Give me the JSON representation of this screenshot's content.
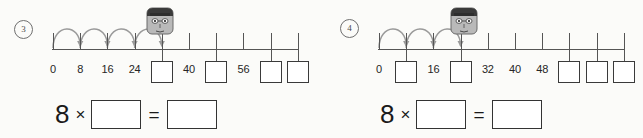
{
  "worksheet": {
    "background_color": "#fbfbf9",
    "ink_color": "#333333",
    "arc_color": "#9a9a9a",
    "panels": [
      {
        "id": "problem-3",
        "number_label": "3",
        "marker_icon": "student-head-icon",
        "marker_tick_index": 4,
        "jump_count": 4,
        "axis": {
          "tick_count": 10,
          "step": 8,
          "start": 0,
          "end": 72
        },
        "ticks": [
          {
            "index": 0,
            "type": "label",
            "text": "0"
          },
          {
            "index": 1,
            "type": "label",
            "text": "8"
          },
          {
            "index": 2,
            "type": "label",
            "text": "16"
          },
          {
            "index": 3,
            "type": "label",
            "text": "24"
          },
          {
            "index": 4,
            "type": "box",
            "text": ""
          },
          {
            "index": 5,
            "type": "label",
            "text": "40"
          },
          {
            "index": 6,
            "type": "box",
            "text": ""
          },
          {
            "index": 7,
            "type": "label",
            "text": "56"
          },
          {
            "index": 8,
            "type": "box",
            "text": ""
          },
          {
            "index": 9,
            "type": "box",
            "text": ""
          }
        ],
        "equation": {
          "factor": "8",
          "operator": "×",
          "equals": "=",
          "factor_answer": "",
          "product_answer": ""
        }
      },
      {
        "id": "problem-4",
        "number_label": "4",
        "marker_icon": "student-head-icon",
        "marker_tick_index": 3,
        "jump_count": 3,
        "axis": {
          "tick_count": 10,
          "step": 8,
          "start": 0,
          "end": 72
        },
        "ticks": [
          {
            "index": 0,
            "type": "label",
            "text": "0"
          },
          {
            "index": 1,
            "type": "box",
            "text": ""
          },
          {
            "index": 2,
            "type": "label",
            "text": "16"
          },
          {
            "index": 3,
            "type": "box",
            "text": ""
          },
          {
            "index": 4,
            "type": "label",
            "text": "32"
          },
          {
            "index": 5,
            "type": "label",
            "text": "40"
          },
          {
            "index": 6,
            "type": "label",
            "text": "48"
          },
          {
            "index": 7,
            "type": "box",
            "text": ""
          },
          {
            "index": 8,
            "type": "box",
            "text": ""
          },
          {
            "index": 9,
            "type": "box",
            "text": ""
          }
        ],
        "equation": {
          "factor": "8",
          "operator": "×",
          "equals": "=",
          "factor_answer": "",
          "product_answer": ""
        }
      }
    ]
  }
}
